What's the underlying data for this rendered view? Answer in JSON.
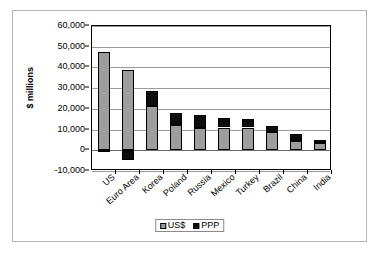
{
  "chart_data": {
    "type": "bar",
    "subtype": "stacked-column",
    "title": "",
    "xlabel": "",
    "ylabel": "$ millions",
    "ylim": [
      -10000,
      60000
    ],
    "ytick_step": 10000,
    "ytick_labels": [
      "60,000",
      "50,000",
      "40,000",
      "30,000",
      "20,000",
      "10,000",
      "0",
      "-10,000"
    ],
    "ytick_values": [
      60000,
      50000,
      40000,
      30000,
      20000,
      10000,
      0,
      -10000
    ],
    "grid": true,
    "legend_position": "bottom-center",
    "categories": [
      "US",
      "Euro Area",
      "Korea",
      "Poland",
      "Russia",
      "Mexico",
      "Turkey",
      "Brazil",
      "China",
      "India"
    ],
    "series": [
      {
        "name": "US$",
        "color": "#9d9d9d",
        "values": [
          47500,
          38700,
          21500,
          12300,
          10800,
          11000,
          11000,
          9000,
          4500,
          3500
        ]
      },
      {
        "name": "PPP",
        "color": "#0d0d0d",
        "values": [
          -300,
          -4500,
          7000,
          5700,
          6000,
          4500,
          4200,
          2600,
          3300,
          1500
        ]
      }
    ],
    "totals": [
      47200,
      34200,
      28500,
      18000,
      16800,
      15500,
      15200,
      11600,
      7800,
      5000
    ]
  },
  "legend": {
    "items": [
      {
        "label": "US$",
        "swatch": "gray-square-icon"
      },
      {
        "label": "PPP",
        "swatch": "black-square-icon"
      }
    ]
  },
  "axis": {
    "y_title": "$ millions"
  }
}
